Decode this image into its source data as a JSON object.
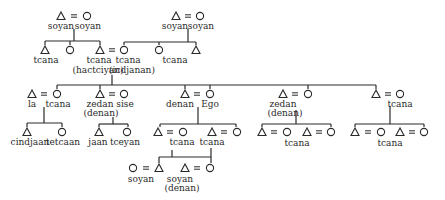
{
  "diagram": {
    "type": "kinship-chart",
    "colors": {
      "ink": "#2a2a2a",
      "background": "#ffffff"
    },
    "symbols": [
      {
        "id": "s1",
        "shape": "triangle",
        "x": 61,
        "y": 16
      },
      {
        "id": "s2",
        "shape": "circle",
        "x": 87,
        "y": 16
      },
      {
        "id": "s3",
        "shape": "triangle",
        "x": 176,
        "y": 16
      },
      {
        "id": "s4",
        "shape": "circle",
        "x": 200,
        "y": 16
      },
      {
        "id": "s5",
        "shape": "triangle",
        "x": 45,
        "y": 50
      },
      {
        "id": "s6",
        "shape": "circle",
        "x": 70,
        "y": 50
      },
      {
        "id": "s7",
        "shape": "triangle",
        "x": 100,
        "y": 50
      },
      {
        "id": "s8",
        "shape": "circle",
        "x": 124,
        "y": 50
      },
      {
        "id": "s9",
        "shape": "circle",
        "x": 159,
        "y": 50
      },
      {
        "id": "s10",
        "shape": "triangle",
        "x": 196,
        "y": 50
      },
      {
        "id": "s11",
        "shape": "triangle",
        "x": 32,
        "y": 94
      },
      {
        "id": "s12",
        "shape": "circle",
        "x": 57,
        "y": 94
      },
      {
        "id": "s13",
        "shape": "triangle",
        "x": 100,
        "y": 94
      },
      {
        "id": "s14",
        "shape": "circle",
        "x": 124,
        "y": 94
      },
      {
        "id": "s15",
        "shape": "triangle",
        "x": 185,
        "y": 94
      },
      {
        "id": "s16",
        "shape": "circle",
        "x": 210,
        "y": 94
      },
      {
        "id": "s17",
        "shape": "triangle",
        "x": 283,
        "y": 94
      },
      {
        "id": "s18",
        "shape": "circle",
        "x": 308,
        "y": 94
      },
      {
        "id": "s19",
        "shape": "triangle",
        "x": 376,
        "y": 94
      },
      {
        "id": "s20",
        "shape": "circle",
        "x": 400,
        "y": 94
      },
      {
        "id": "s21",
        "shape": "triangle",
        "x": 27,
        "y": 132
      },
      {
        "id": "s22",
        "shape": "circle",
        "x": 62,
        "y": 132
      },
      {
        "id": "s23",
        "shape": "triangle",
        "x": 99,
        "y": 132
      },
      {
        "id": "s24",
        "shape": "circle",
        "x": 127,
        "y": 132
      },
      {
        "id": "s25",
        "shape": "triangle",
        "x": 158,
        "y": 132
      },
      {
        "id": "s26",
        "shape": "circle",
        "x": 183,
        "y": 132
      },
      {
        "id": "s27",
        "shape": "triangle",
        "x": 212,
        "y": 132
      },
      {
        "id": "s28",
        "shape": "circle",
        "x": 237,
        "y": 132
      },
      {
        "id": "s29",
        "shape": "triangle",
        "x": 262,
        "y": 132
      },
      {
        "id": "s30",
        "shape": "circle",
        "x": 287,
        "y": 132
      },
      {
        "id": "s31",
        "shape": "triangle",
        "x": 307,
        "y": 132
      },
      {
        "id": "s32",
        "shape": "circle",
        "x": 331,
        "y": 132
      },
      {
        "id": "s33",
        "shape": "triangle",
        "x": 355,
        "y": 132
      },
      {
        "id": "s34",
        "shape": "circle",
        "x": 381,
        "y": 132
      },
      {
        "id": "s35",
        "shape": "triangle",
        "x": 400,
        "y": 132
      },
      {
        "id": "s36",
        "shape": "circle",
        "x": 424,
        "y": 132
      },
      {
        "id": "s37",
        "shape": "circle",
        "x": 133,
        "y": 168
      },
      {
        "id": "s38",
        "shape": "triangle",
        "x": 159,
        "y": 168
      },
      {
        "id": "s39",
        "shape": "triangle",
        "x": 185,
        "y": 168
      },
      {
        "id": "s40",
        "shape": "circle",
        "x": 210,
        "y": 168
      }
    ],
    "marriages": [
      {
        "x": 74,
        "y": 16
      },
      {
        "x": 188,
        "y": 16
      },
      {
        "x": 112,
        "y": 50
      },
      {
        "x": 44,
        "y": 94
      },
      {
        "x": 112,
        "y": 94
      },
      {
        "x": 197,
        "y": 94
      },
      {
        "x": 295,
        "y": 94
      },
      {
        "x": 388,
        "y": 94
      },
      {
        "x": 170,
        "y": 132
      },
      {
        "x": 224,
        "y": 132
      },
      {
        "x": 274,
        "y": 132
      },
      {
        "x": 319,
        "y": 132
      },
      {
        "x": 368,
        "y": 132
      },
      {
        "x": 412,
        "y": 132
      },
      {
        "x": 146,
        "y": 168
      },
      {
        "x": 197,
        "y": 168
      }
    ],
    "lines": [
      [
        74,
        29,
        74,
        41
      ],
      [
        45,
        41,
        100,
        41
      ],
      [
        45,
        41,
        45,
        45
      ],
      [
        70,
        41,
        70,
        45
      ],
      [
        100,
        41,
        100,
        45
      ],
      [
        188,
        29,
        188,
        42
      ],
      [
        124,
        42,
        196,
        42
      ],
      [
        124,
        42,
        124,
        45
      ],
      [
        159,
        42,
        159,
        45
      ],
      [
        196,
        42,
        196,
        45
      ],
      [
        112,
        75,
        112,
        85
      ],
      [
        57,
        85,
        210,
        85
      ],
      [
        57,
        85,
        57,
        89
      ],
      [
        100,
        85,
        100,
        89
      ],
      [
        185,
        85,
        185,
        89
      ],
      [
        210,
        85,
        376,
        85
      ],
      [
        210,
        85,
        210,
        89
      ],
      [
        308,
        85,
        308,
        89
      ],
      [
        376,
        85,
        376,
        89
      ],
      [
        44,
        107,
        44,
        123
      ],
      [
        27,
        123,
        62,
        123
      ],
      [
        27,
        123,
        27,
        127
      ],
      [
        62,
        123,
        62,
        127
      ],
      [
        113,
        117,
        113,
        124
      ],
      [
        99,
        124,
        128,
        124
      ],
      [
        99,
        124,
        99,
        127
      ],
      [
        128,
        124,
        128,
        127
      ],
      [
        198,
        107,
        198,
        124
      ],
      [
        160,
        124,
        236,
        124
      ],
      [
        160,
        124,
        160,
        127
      ],
      [
        236,
        124,
        236,
        127
      ],
      [
        296,
        110,
        296,
        124
      ],
      [
        262,
        124,
        331,
        124
      ],
      [
        262,
        124,
        262,
        127
      ],
      [
        331,
        124,
        331,
        127
      ],
      [
        390,
        106,
        390,
        124
      ],
      [
        355,
        124,
        424,
        124
      ],
      [
        355,
        124,
        355,
        127
      ],
      [
        424,
        124,
        424,
        127
      ],
      [
        172,
        150,
        172,
        157
      ],
      [
        159,
        157,
        211,
        157
      ],
      [
        159,
        157,
        159,
        163
      ],
      [
        211,
        148,
        211,
        163
      ]
    ],
    "labels": [
      {
        "text": "soyan",
        "x": 61,
        "y": 21
      },
      {
        "text": "soyan",
        "x": 88,
        "y": 21
      },
      {
        "text": "soyan",
        "x": 175,
        "y": 21
      },
      {
        "text": "soyan",
        "x": 201,
        "y": 21
      },
      {
        "text": "tcana",
        "x": 46,
        "y": 55
      },
      {
        "text": "tcana",
        "x": 99,
        "y": 55
      },
      {
        "text": "(hactciyan)",
        "x": 98,
        "y": 65
      },
      {
        "text": "tcana",
        "x": 128,
        "y": 55
      },
      {
        "text": "(icdjanan)",
        "x": 132,
        "y": 65
      },
      {
        "text": "tcana",
        "x": 175,
        "y": 55
      },
      {
        "text": "la",
        "x": 32,
        "y": 99
      },
      {
        "text": "tcana",
        "x": 58,
        "y": 99
      },
      {
        "text": "zedan",
        "x": 100,
        "y": 99
      },
      {
        "text": "(denan)",
        "x": 101,
        "y": 108
      },
      {
        "text": "sise",
        "x": 125,
        "y": 99
      },
      {
        "text": "denan",
        "x": 180,
        "y": 99
      },
      {
        "text": "Ego",
        "x": 210,
        "y": 99
      },
      {
        "text": "zedan",
        "x": 283,
        "y": 99
      },
      {
        "text": "(denan)",
        "x": 285,
        "y": 108
      },
      {
        "text": "tcana",
        "x": 400,
        "y": 99
      },
      {
        "text": "cindjaan",
        "x": 30,
        "y": 137
      },
      {
        "text": "tetcaan",
        "x": 63,
        "y": 137
      },
      {
        "text": "jaan",
        "x": 98,
        "y": 137
      },
      {
        "text": "tceyan",
        "x": 125,
        "y": 137
      },
      {
        "text": "tcana",
        "x": 182,
        "y": 137
      },
      {
        "text": "tcana",
        "x": 212,
        "y": 137
      },
      {
        "text": "tcana",
        "x": 297,
        "y": 138
      },
      {
        "text": "tcana",
        "x": 390,
        "y": 138
      },
      {
        "text": "soyan",
        "x": 141,
        "y": 174
      },
      {
        "text": "soyan",
        "x": 180,
        "y": 174
      },
      {
        "text": "(denan)",
        "x": 182,
        "y": 183
      }
    ]
  }
}
